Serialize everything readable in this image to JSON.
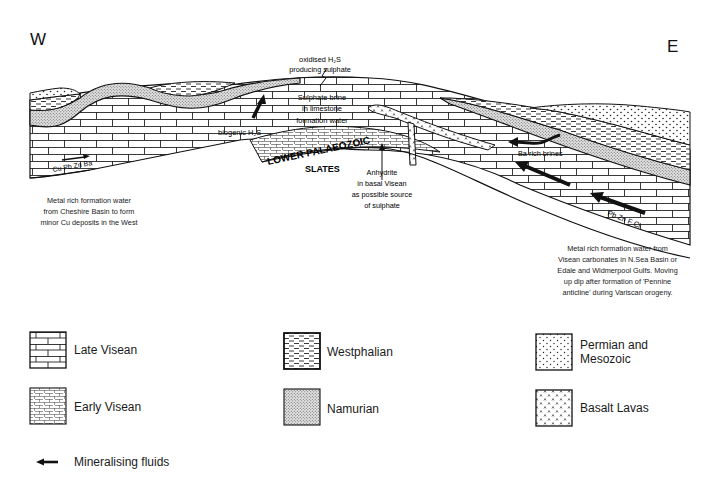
{
  "compass": {
    "west": "W",
    "east": "E"
  },
  "cross_section": {
    "labels": {
      "oxidised_h2s_line1": "oxidised H₂S",
      "oxidised_h2s_line2": "producing sulphate",
      "sulphate_brine_line1": "Sulphate brine",
      "sulphate_brine_line2": "in limestone",
      "sulphate_brine_line3": "formation water",
      "biogenic_h2s": "biogenic H₂S",
      "lower_palaeozoic": "LOWER PALAEOZOIC",
      "slates": "SLATES",
      "anhydrite_line1": "Anhydrite",
      "anhydrite_line2": "in basal Visean",
      "anhydrite_line3": "as possible source",
      "anhydrite_line4": "of sulphate",
      "ba_rich_brines": "Ba rich brines",
      "cu_pb_zn_ba": "Cu Pb Zn Ba",
      "pb_zn_f_cl": "Pb Zn F Cl"
    },
    "west_note": [
      "Metal rich formation water",
      "from Cheshire Basin to form",
      "minor Cu deposits in the West"
    ],
    "east_note": [
      "Metal rich formation water from",
      "Visean carbonates in N.Sea Basin or",
      "Edale and Widmerpool Gulfs. Moving",
      "up dip after formation of 'Pennine",
      "anticline' during Variscan orogeny."
    ]
  },
  "legend": {
    "items": [
      {
        "id": "late-visean",
        "label": "Late Visean",
        "pattern": "large-brick"
      },
      {
        "id": "early-visean",
        "label": "Early Visean",
        "pattern": "small-dashed-brick"
      },
      {
        "id": "westphalian",
        "label": "Westphalian",
        "pattern": "dashes"
      },
      {
        "id": "namurian",
        "label": "Namurian",
        "pattern": "fine-stipple"
      },
      {
        "id": "permian-mesozoic",
        "label_line1": "Permian and",
        "label_line2": "Mesozoic",
        "pattern": "dots"
      },
      {
        "id": "basalt-lavas",
        "label": "Basalt Lavas",
        "pattern": "carets"
      }
    ],
    "arrow_item": {
      "label": "Mineralising fluids",
      "icon": "left-arrow"
    }
  },
  "colors": {
    "ink": "#111111",
    "background": "#ffffff"
  }
}
